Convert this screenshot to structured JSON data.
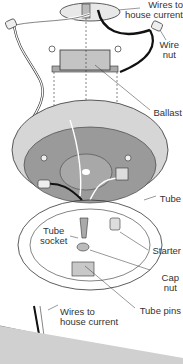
{
  "diagram": {
    "labels": {
      "wires_top": [
        "Wires to",
        "house current"
      ],
      "wire_nut": [
        "Wire",
        "nut"
      ],
      "ballast": "Ballast",
      "tube": "Tube",
      "tube_socket": [
        "Tube",
        "socket"
      ],
      "starter": "Starter",
      "cap_nut": [
        "Cap",
        "nut"
      ],
      "tube_pins": "Tube pins",
      "wires_bottom": [
        "Wires to",
        "house current"
      ]
    },
    "colors": {
      "line": "#333333",
      "pan_outer": "#d6d6d6",
      "pan_inner": "#9a9a9a",
      "ballast": "#c4c4c4",
      "fixture_bar": "#dcdcdc"
    }
  }
}
